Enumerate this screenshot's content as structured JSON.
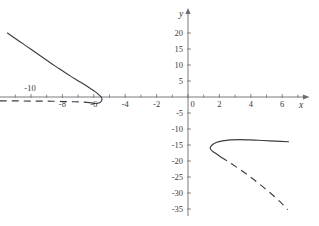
{
  "figure": {
    "title": "",
    "axis_labels": {
      "x": "x",
      "y": "y"
    }
  },
  "chart_data": {
    "type": "line",
    "title": "",
    "xlabel": "x",
    "ylabel": "y",
    "grid": false,
    "legend": null,
    "xlim": [
      -12.2,
      7.4
    ],
    "ylim": [
      -37.5,
      22.5
    ],
    "x_tick_labels": [
      "-10",
      "-8",
      "-6",
      "-4",
      "-2",
      "0",
      "2",
      "4",
      "6"
    ],
    "x_tick_values": [
      -10,
      -8,
      -6,
      -4,
      -2,
      0,
      2,
      4,
      6
    ],
    "x_minor_tick_values": [
      -11,
      -9,
      -7,
      -5,
      -3,
      -1,
      1,
      3,
      5,
      7
    ],
    "y_tick_labels": [
      "20",
      "15",
      "10",
      "5",
      "-5",
      "-10",
      "-15",
      "-20",
      "-25",
      "-30",
      "-35"
    ],
    "y_tick_values": [
      20,
      15,
      10,
      5,
      -5,
      -10,
      -15,
      -20,
      -25,
      -30,
      -35
    ],
    "series": [
      {
        "name": "left-branch-solid",
        "style": "solid",
        "color": "#3c3c42",
        "points": [
          [
            -11.5,
            20.0
          ],
          [
            -11.0,
            18.3
          ],
          [
            -10.5,
            16.6
          ],
          [
            -10.0,
            14.9
          ],
          [
            -9.5,
            13.2
          ],
          [
            -9.0,
            11.5
          ],
          [
            -8.5,
            9.8
          ],
          [
            -8.0,
            8.2
          ],
          [
            -7.5,
            6.6
          ],
          [
            -7.0,
            5.1
          ],
          [
            -6.5,
            3.6
          ],
          [
            -6.2,
            2.6
          ],
          [
            -5.9,
            1.6
          ],
          [
            -5.7,
            0.8
          ],
          [
            -5.55,
            0.1
          ],
          [
            -5.48,
            -0.6
          ],
          [
            -5.5,
            -1.2
          ],
          [
            -5.6,
            -1.7
          ],
          [
            -5.8,
            -2.0
          ],
          [
            -6.0,
            -2.0
          ],
          [
            -6.2,
            -1.8
          ]
        ]
      },
      {
        "name": "left-branch-dashed",
        "style": "dashed",
        "color": "#3c3c42",
        "points": [
          [
            -6.2,
            -1.8
          ],
          [
            -6.6,
            -1.6
          ],
          [
            -7.2,
            -1.5
          ],
          [
            -8.0,
            -1.4
          ],
          [
            -9.0,
            -1.3
          ],
          [
            -10.0,
            -1.3
          ],
          [
            -11.0,
            -1.2
          ],
          [
            -12.0,
            -1.2
          ]
        ]
      },
      {
        "name": "right-branch-solid",
        "style": "solid",
        "color": "#3c3c42",
        "points": [
          [
            6.4,
            -14.0
          ],
          [
            5.6,
            -13.8
          ],
          [
            4.8,
            -13.6
          ],
          [
            4.0,
            -13.4
          ],
          [
            3.3,
            -13.3
          ],
          [
            2.7,
            -13.4
          ],
          [
            2.2,
            -13.7
          ],
          [
            1.8,
            -14.2
          ],
          [
            1.55,
            -14.9
          ],
          [
            1.42,
            -15.7
          ],
          [
            1.45,
            -16.4
          ],
          [
            1.6,
            -17.1
          ],
          [
            1.85,
            -17.9
          ],
          [
            2.1,
            -18.8
          ]
        ]
      },
      {
        "name": "right-branch-dashed",
        "style": "dashed",
        "color": "#3c3c42",
        "points": [
          [
            2.1,
            -18.8
          ],
          [
            2.5,
            -20.0
          ],
          [
            3.0,
            -21.6
          ],
          [
            3.5,
            -23.3
          ],
          [
            4.0,
            -25.1
          ],
          [
            4.5,
            -27.0
          ],
          [
            5.0,
            -29.0
          ],
          [
            5.5,
            -31.1
          ],
          [
            6.0,
            -33.4
          ],
          [
            6.35,
            -35.2
          ]
        ]
      }
    ]
  }
}
